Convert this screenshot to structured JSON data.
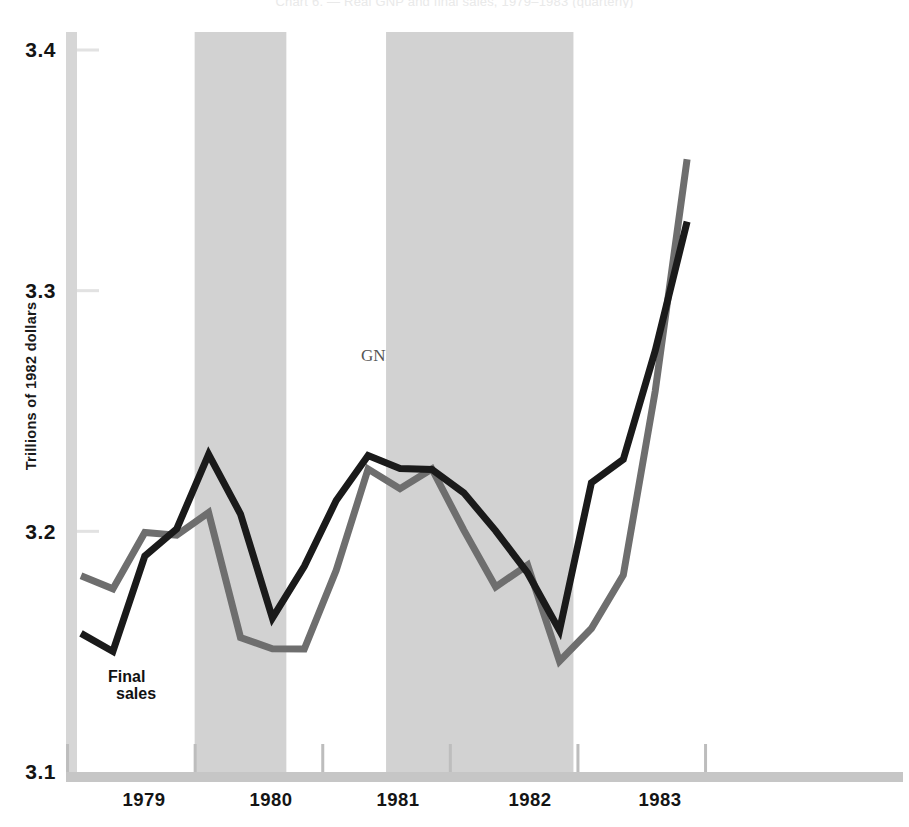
{
  "title": "Chart 6. — Real GNP and final sales, 1979–1983 (quarterly)",
  "axes": {
    "y_label": "Trillions of 1982 dollars",
    "y_ticks": [
      "3.4",
      "3.3",
      "3.2",
      "3.1"
    ],
    "x_ticks": [
      "1979",
      "1980",
      "1981",
      "1982",
      "1983"
    ]
  },
  "labels": {
    "gnp": "GNP",
    "final_sales_line1": "Final",
    "final_sales_line2": "sales"
  },
  "colors": {
    "gnp_line": "#6e6e6e",
    "final_sales_line": "#1a1a1a",
    "recession_band": "#d2d2d2",
    "axis": "#c9c9c9",
    "background": "#ffffff"
  },
  "chart_data": {
    "type": "line",
    "title": "Real GNP and final sales",
    "xlabel": "",
    "ylabel": "Trillions of 1982 dollars",
    "ylim": [
      3.1,
      3.4
    ],
    "grid": false,
    "legend": "inline-annotations",
    "x": [
      "1979Q1",
      "1979Q2",
      "1979Q3",
      "1979Q4",
      "1980Q1",
      "1980Q2",
      "1980Q3",
      "1980Q4",
      "1981Q1",
      "1981Q2",
      "1981Q3",
      "1981Q4",
      "1982Q1",
      "1982Q2",
      "1982Q3",
      "1982Q4",
      "1983Q1",
      "1983Q2",
      "1983Q3",
      "1983Q4"
    ],
    "series": [
      {
        "name": "GNP",
        "color": "#6e6e6e",
        "values": [
          3.1815,
          3.1761,
          3.1995,
          3.1984,
          3.2078,
          3.1559,
          3.1512,
          3.1511,
          3.1838,
          3.2259,
          3.2177,
          3.2259,
          3.2005,
          3.1769,
          3.186,
          3.146,
          3.1596,
          3.1818,
          3.2582,
          3.3546
        ]
      },
      {
        "name": "Final sales",
        "color": "#1a1a1a",
        "values": [
          3.1576,
          3.1501,
          3.1897,
          3.201,
          3.232,
          3.2072,
          3.164,
          3.1855,
          3.2128,
          3.2315,
          3.2261,
          3.2257,
          3.216,
          3.2002,
          3.1827,
          3.1588,
          3.2202,
          3.2299,
          3.275,
          3.3287
        ]
      }
    ],
    "recession_bands": [
      {
        "start": "1980Q1",
        "end": "1980Q3"
      },
      {
        "start": "1981Q3",
        "end": "1982Q4"
      }
    ],
    "annotations": [
      {
        "text": "GNP",
        "x": "1981Q1"
      },
      {
        "text": "Final sales",
        "x": "1979Q1"
      }
    ]
  }
}
